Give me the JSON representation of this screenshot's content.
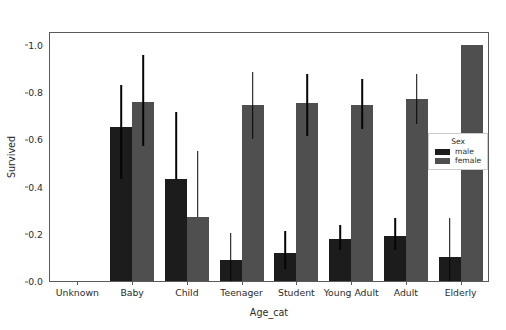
{
  "chart_data": {
    "type": "bar",
    "title": "",
    "xlabel": "Age_cat",
    "ylabel": "Survived",
    "ylim": [
      0.0,
      1.05
    ],
    "yticks": [
      0.0,
      0.2,
      0.4,
      0.6,
      0.8,
      1.0
    ],
    "ytick_labels": [
      "0.0",
      "0.2",
      "0.4",
      "0.6",
      "0.8",
      "1.0"
    ],
    "grid": false,
    "legend": {
      "title": "Sex",
      "position": "center-right",
      "entries": [
        {
          "name": "male",
          "color": "#1c1c1c"
        },
        {
          "name": "female",
          "color": "#4f4f4f"
        }
      ]
    },
    "categories": [
      "Unknown",
      "Baby",
      "Child",
      "Teenager",
      "Student",
      "Young Adult",
      "Adult",
      "Elderly"
    ],
    "series": [
      {
        "name": "male",
        "color": "#1c1c1c",
        "values": [
          null,
          0.65,
          0.43,
          0.09,
          0.12,
          0.18,
          0.19,
          0.1
        ],
        "ci_low": [
          null,
          0.43,
          0.43,
          0.0,
          0.05,
          0.13,
          0.13,
          0.0
        ],
        "ci_high": [
          null,
          0.83,
          0.715,
          0.205,
          0.21,
          0.235,
          0.265,
          0.265
        ]
      },
      {
        "name": "female",
        "color": "#4f4f4f",
        "values": [
          null,
          0.76,
          0.27,
          0.745,
          0.755,
          0.745,
          0.77,
          1.0
        ],
        "ci_low": [
          null,
          0.57,
          0.27,
          0.6,
          0.615,
          0.645,
          0.665,
          1.0
        ],
        "ci_high": [
          null,
          0.955,
          0.55,
          0.885,
          0.875,
          0.855,
          0.875,
          1.0
        ]
      }
    ]
  },
  "axes": {
    "ylabel": "Survived",
    "xlabel": "Age_cat"
  },
  "legend": {
    "title": "Sex",
    "male_label": "male",
    "female_label": "female"
  },
  "header": {
    "clipped_text": ""
  }
}
